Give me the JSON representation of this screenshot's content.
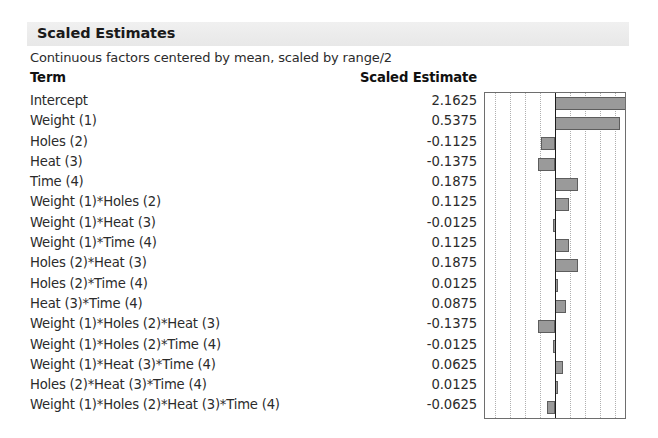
{
  "panel": {
    "title": "Scaled Estimates",
    "subtitle": "Continuous factors centered by mean, scaled by range/2"
  },
  "table": {
    "headers": {
      "term": "Term",
      "estimate": "Scaled Estimate"
    },
    "rows": [
      {
        "term": "Intercept",
        "estimate": "2.1625"
      },
      {
        "term": "Weight (1)",
        "estimate": "0.5375"
      },
      {
        "term": "Holes (2)",
        "estimate": "-0.1125"
      },
      {
        "term": "Heat (3)",
        "estimate": "-0.1375"
      },
      {
        "term": "Time (4)",
        "estimate": "0.1875"
      },
      {
        "term": "Weight (1)*Holes (2)",
        "estimate": "0.1125"
      },
      {
        "term": "Weight (1)*Heat (3)",
        "estimate": "-0.0125"
      },
      {
        "term": "Weight (1)*Time (4)",
        "estimate": "0.1125"
      },
      {
        "term": "Holes (2)*Heat (3)",
        "estimate": "0.1875"
      },
      {
        "term": "Holes (2)*Time (4)",
        "estimate": "0.0125"
      },
      {
        "term": "Heat (3)*Time (4)",
        "estimate": "0.0875"
      },
      {
        "term": "Weight (1)*Holes (2)*Heat (3)",
        "estimate": "-0.1375"
      },
      {
        "term": "Weight (1)*Holes (2)*Time (4)",
        "estimate": "-0.0125"
      },
      {
        "term": "Weight (1)*Heat (3)*Time (4)",
        "estimate": "0.0625"
      },
      {
        "term": "Holes (2)*Heat (3)*Time (4)",
        "estimate": "0.0125"
      },
      {
        "term": "Weight (1)*Holes (2)*Heat (3)*Time (4)",
        "estimate": "-0.0625"
      }
    ]
  },
  "chart_data": {
    "type": "bar",
    "orientation": "horizontal",
    "title": "Scaled Estimates",
    "xlabel": "",
    "ylabel": "",
    "grid": true,
    "gridlines_x": [
      -0.5,
      -0.375,
      -0.25,
      -0.125,
      0.125,
      0.25,
      0.375,
      0.5
    ],
    "zero_line": 0,
    "xlim": [
      -0.58,
      0.58
    ],
    "legend": "none",
    "categories": [
      "Intercept",
      "Weight (1)",
      "Holes (2)",
      "Heat (3)",
      "Time (4)",
      "Weight (1)*Holes (2)",
      "Weight (1)*Heat (3)",
      "Weight (1)*Time (4)",
      "Holes (2)*Heat (3)",
      "Holes (2)*Time (4)",
      "Heat (3)*Time (4)",
      "Weight (1)*Holes (2)*Heat (3)",
      "Weight (1)*Holes (2)*Time (4)",
      "Weight (1)*Heat (3)*Time (4)",
      "Holes (2)*Heat (3)*Time (4)",
      "Weight (1)*Holes (2)*Heat (3)*Time (4)"
    ],
    "values": [
      2.1625,
      0.5375,
      -0.1125,
      -0.1375,
      0.1875,
      0.1125,
      -0.0125,
      0.1125,
      0.1875,
      0.0125,
      0.0875,
      -0.1375,
      -0.0125,
      0.0625,
      0.0125,
      -0.0625
    ],
    "bar_color": "#9a9a9a",
    "bar_border_color": "#5d5d5d",
    "frame_color": "#6e6e6e",
    "gridline_color": "#b0b0b0",
    "zero_line_color": "#1d1d1d"
  }
}
